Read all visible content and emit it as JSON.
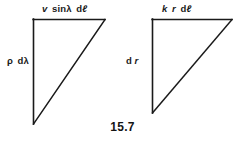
{
  "figure": {
    "caption": "15.7",
    "background_color": "#ffffff",
    "stroke_color": "#1a1a1a",
    "triangles": [
      {
        "name": "left-triangle",
        "vertices": [
          [
            33,
            19
          ],
          [
            105,
            19
          ],
          [
            33,
            124
          ]
        ],
        "top_label": {
          "parts": [
            {
              "text": "v",
              "style": "italic"
            },
            {
              "text": "sin",
              "style": "upright"
            },
            {
              "text": "λ",
              "style": "upright"
            },
            {
              "text": "d",
              "style": "upright"
            },
            {
              "text": "ℓ",
              "style": "italic"
            }
          ],
          "plain": "v sinλ dℓ"
        },
        "side_label": {
          "parts": [
            {
              "text": "ρ",
              "style": "upright"
            },
            {
              "text": "d",
              "style": "upright"
            },
            {
              "text": "λ",
              "style": "upright"
            }
          ],
          "plain": "ρ dλ"
        }
      },
      {
        "name": "right-triangle",
        "vertices": [
          [
            152,
            19
          ],
          [
            232,
            19
          ],
          [
            152,
            113
          ]
        ],
        "top_label": {
          "parts": [
            {
              "text": "k",
              "style": "italic"
            },
            {
              "text": "r",
              "style": "italic"
            },
            {
              "text": "d",
              "style": "upright"
            },
            {
              "text": "ℓ",
              "style": "italic"
            }
          ],
          "plain": "k r dℓ"
        },
        "side_label": {
          "parts": [
            {
              "text": "d",
              "style": "upright"
            },
            {
              "text": "r",
              "style": "italic"
            }
          ],
          "plain": "d r"
        }
      }
    ]
  }
}
